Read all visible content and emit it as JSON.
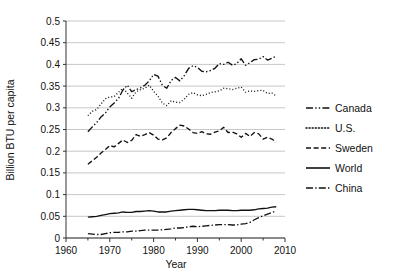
{
  "chart_data": {
    "type": "line",
    "title": "",
    "xlabel": "Year",
    "ylabel": "Billion BTU per capita",
    "xlim": [
      1960,
      2010
    ],
    "ylim": [
      0,
      0.5
    ],
    "grid": "horizontal",
    "legend_position": "right",
    "xticks": [
      1960,
      1970,
      1980,
      1990,
      2000,
      2010
    ],
    "xtick_labels": [
      "1960",
      "1970",
      "1980",
      "1990",
      "2000",
      "2010"
    ],
    "xminor_ticks": [
      1965,
      1975,
      1985,
      1995,
      2005
    ],
    "yticks": [
      0,
      0.05,
      0.1,
      0.15,
      0.2,
      0.25,
      0.3,
      0.35,
      0.4,
      0.45,
      0.5
    ],
    "ytick_labels": [
      "0",
      "0.05",
      "0.1",
      "0.15",
      "0.2",
      "0.25",
      "0.3",
      "0.35",
      "0.4",
      "0.45",
      "0.5"
    ],
    "x": [
      1965,
      1966,
      1967,
      1968,
      1969,
      1970,
      1971,
      1972,
      1973,
      1974,
      1975,
      1976,
      1977,
      1978,
      1979,
      1980,
      1981,
      1982,
      1983,
      1984,
      1985,
      1986,
      1987,
      1988,
      1989,
      1990,
      1991,
      1992,
      1993,
      1994,
      1995,
      1996,
      1997,
      1998,
      1999,
      2000,
      2001,
      2002,
      2003,
      2004,
      2005,
      2006,
      2007,
      2008
    ],
    "series": [
      {
        "name": "Canada",
        "dash": "dash-dot-dot",
        "values": [
          0.245,
          0.256,
          0.266,
          0.279,
          0.288,
          0.302,
          0.311,
          0.322,
          0.341,
          0.352,
          0.337,
          0.342,
          0.346,
          0.352,
          0.362,
          0.377,
          0.373,
          0.352,
          0.345,
          0.363,
          0.37,
          0.362,
          0.374,
          0.391,
          0.397,
          0.393,
          0.384,
          0.383,
          0.386,
          0.391,
          0.402,
          0.4,
          0.405,
          0.398,
          0.402,
          0.413,
          0.398,
          0.404,
          0.411,
          0.412,
          0.418,
          0.41,
          0.414,
          0.419
        ]
      },
      {
        "name": "U.S.",
        "dash": "dotted",
        "values": [
          0.282,
          0.292,
          0.296,
          0.309,
          0.321,
          0.325,
          0.326,
          0.336,
          0.345,
          0.334,
          0.322,
          0.337,
          0.342,
          0.345,
          0.352,
          0.338,
          0.327,
          0.311,
          0.305,
          0.316,
          0.313,
          0.312,
          0.32,
          0.331,
          0.335,
          0.33,
          0.328,
          0.331,
          0.335,
          0.337,
          0.339,
          0.345,
          0.344,
          0.342,
          0.345,
          0.348,
          0.336,
          0.339,
          0.338,
          0.34,
          0.34,
          0.333,
          0.334,
          0.327
        ]
      },
      {
        "name": "Sweden",
        "dash": "dashed",
        "values": [
          0.17,
          0.178,
          0.186,
          0.196,
          0.204,
          0.213,
          0.21,
          0.218,
          0.226,
          0.22,
          0.225,
          0.238,
          0.234,
          0.238,
          0.243,
          0.237,
          0.228,
          0.226,
          0.231,
          0.243,
          0.252,
          0.26,
          0.258,
          0.251,
          0.243,
          0.241,
          0.245,
          0.24,
          0.239,
          0.244,
          0.247,
          0.255,
          0.243,
          0.244,
          0.24,
          0.232,
          0.241,
          0.234,
          0.243,
          0.24,
          0.228,
          0.232,
          0.228,
          0.221
        ]
      },
      {
        "name": "World",
        "dash": "solid",
        "values": [
          0.048,
          0.049,
          0.05,
          0.052,
          0.054,
          0.056,
          0.057,
          0.058,
          0.06,
          0.059,
          0.059,
          0.061,
          0.061,
          0.062,
          0.063,
          0.062,
          0.06,
          0.06,
          0.06,
          0.062,
          0.063,
          0.064,
          0.065,
          0.066,
          0.066,
          0.065,
          0.064,
          0.063,
          0.063,
          0.063,
          0.064,
          0.064,
          0.064,
          0.063,
          0.063,
          0.064,
          0.064,
          0.064,
          0.065,
          0.067,
          0.068,
          0.069,
          0.071,
          0.072
        ]
      },
      {
        "name": "China",
        "dash": "dash-dot",
        "values": [
          0.01,
          0.009,
          0.008,
          0.008,
          0.01,
          0.012,
          0.013,
          0.013,
          0.014,
          0.014,
          0.016,
          0.016,
          0.017,
          0.018,
          0.018,
          0.018,
          0.018,
          0.019,
          0.02,
          0.021,
          0.023,
          0.023,
          0.024,
          0.026,
          0.027,
          0.026,
          0.027,
          0.028,
          0.029,
          0.03,
          0.031,
          0.031,
          0.031,
          0.03,
          0.03,
          0.032,
          0.033,
          0.036,
          0.042,
          0.047,
          0.051,
          0.055,
          0.059,
          0.062
        ]
      }
    ]
  },
  "legend": {
    "items": [
      {
        "label": "Canada",
        "dash": "dash-dot-dot"
      },
      {
        "label": "U.S.",
        "dash": "dotted"
      },
      {
        "label": "Sweden",
        "dash": "dashed"
      },
      {
        "label": "World",
        "dash": "solid"
      },
      {
        "label": "China",
        "dash": "dash-dot"
      }
    ]
  },
  "colors": {
    "line": "#111111",
    "grid": "#b9b9b9",
    "axis": "#333333",
    "background": "#ffffff"
  }
}
